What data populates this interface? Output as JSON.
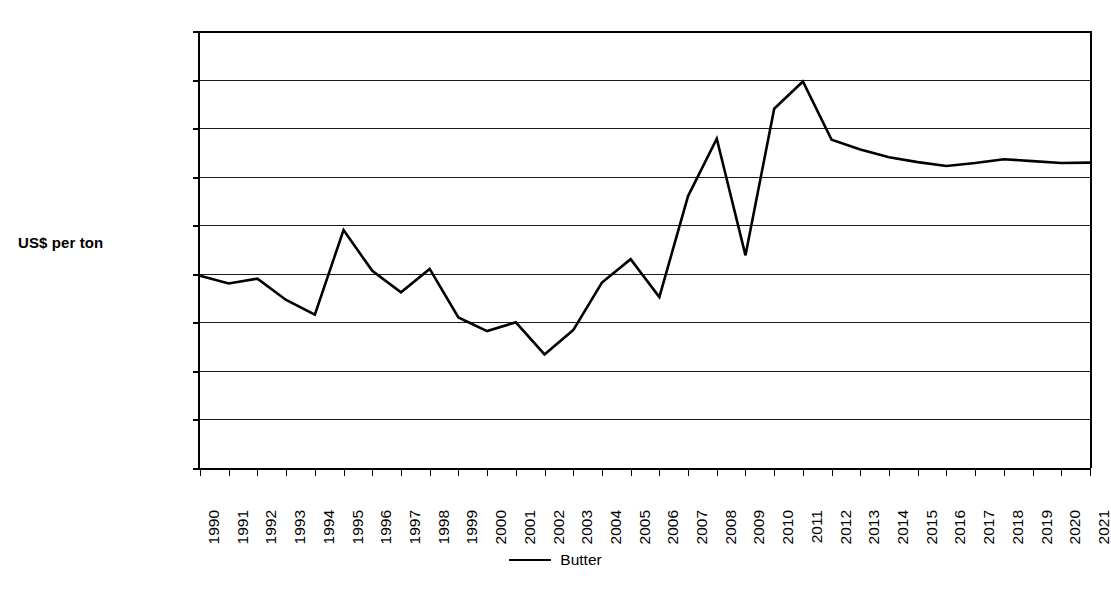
{
  "chart_data": {
    "type": "line",
    "title": "",
    "xlabel": "",
    "ylabel": "US$ per ton",
    "ylim": [
      0,
      4500
    ],
    "ytick_step": 500,
    "yticks": [
      "0",
      "500",
      "1,000",
      "1,500",
      "2,000",
      "2,500",
      "3,000",
      "3,500",
      "4,000",
      "4,500"
    ],
    "ytick_values": [
      0,
      500,
      1000,
      1500,
      2000,
      2500,
      3000,
      3500,
      4000,
      4500
    ],
    "grid": true,
    "legend_position": "bottom-center",
    "categories": [
      "1990",
      "1991",
      "1992",
      "1993",
      "1994",
      "1995",
      "1996",
      "1997",
      "1998",
      "1999",
      "2000",
      "2001",
      "2002",
      "2003",
      "2004",
      "2005",
      "2006",
      "2007",
      "2008",
      "2009",
      "2010",
      "2011",
      "2012",
      "2013",
      "2014",
      "2015",
      "2016",
      "2017",
      "2018",
      "2019",
      "2020",
      "2021"
    ],
    "series": [
      {
        "name": "Butter",
        "color": "#000000",
        "values": [
          1980,
          1900,
          1950,
          1730,
          1580,
          2450,
          2030,
          1810,
          2050,
          1550,
          1410,
          1500,
          1170,
          1420,
          1910,
          2150,
          1760,
          2800,
          3390,
          2190,
          3700,
          3980,
          3380,
          3280,
          3200,
          3150,
          3110,
          3140,
          3180,
          3160,
          3140,
          3145
        ]
      }
    ]
  },
  "legend": {
    "entries": [
      {
        "label": "Butter"
      }
    ]
  },
  "axis": {
    "y_title": "US$ per ton"
  }
}
